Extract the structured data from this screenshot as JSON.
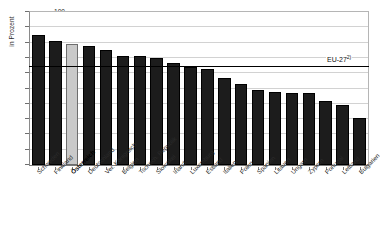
{
  "chart_data": {
    "type": "bar",
    "title": "",
    "xlabel": "",
    "ylabel": "in Prozent",
    "ylim": [
      0,
      100
    ],
    "ytick_step": 10,
    "yticks": [
      100,
      90,
      80,
      70,
      60,
      50,
      40,
      30,
      20,
      10,
      0
    ],
    "grid": true,
    "legend": "none",
    "categories": [
      "Schweden",
      "Finnland",
      "Österreich",
      "Deutschland",
      "Ver. Königreich",
      "Belgien",
      "Tschech. Republik",
      "Slowakei",
      "Irland",
      "Luxemburg",
      "Estland",
      "Italien",
      "Polen",
      "Spanien",
      "Litauen",
      "Ungarn",
      "Zypern",
      "Portugal",
      "Lettland",
      "Bulgarien"
    ],
    "values": [
      85,
      81,
      79,
      78,
      75,
      71.5,
      71,
      70,
      67,
      64,
      62.5,
      57,
      53,
      49,
      48,
      47,
      47,
      42,
      39,
      31
    ],
    "highlight_category": "Österreich",
    "highlight_index": 2,
    "reference_line": {
      "label": "EU-27",
      "footnote_marker": "2)",
      "value": 65
    },
    "colors": {
      "bar": "#1c1c1c",
      "bar_highlight": "#c9c9c9",
      "reference_line": "#000000",
      "gridline": "#d2d2d2",
      "axis": "#7a7a7a"
    }
  },
  "bottom_caption": " "
}
